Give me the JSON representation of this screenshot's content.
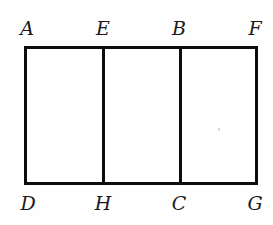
{
  "figure": {
    "type": "geometry-diagram",
    "background_color": "#fefefe",
    "stroke_color": "#0d0d0d",
    "stroke_width_px": 3,
    "labels": {
      "top": [
        {
          "id": "A",
          "text": "A"
        },
        {
          "id": "E",
          "text": "E"
        },
        {
          "id": "B",
          "text": "B"
        },
        {
          "id": "F",
          "text": "F"
        }
      ],
      "bottom": [
        {
          "id": "D",
          "text": "D"
        },
        {
          "id": "H",
          "text": "H"
        },
        {
          "id": "C",
          "text": "C"
        },
        {
          "id": "G",
          "text": "G"
        }
      ]
    },
    "shapes": {
      "outer_rectangle": {
        "corners": [
          "A",
          "F",
          "G",
          "D"
        ]
      },
      "dividers": [
        {
          "id": "EH",
          "from": "E",
          "to": "H"
        },
        {
          "id": "BC",
          "from": "B",
          "to": "C"
        }
      ],
      "cells": [
        {
          "id": "AEHD",
          "corners": [
            "A",
            "E",
            "H",
            "D"
          ]
        },
        {
          "id": "EBCH",
          "corners": [
            "E",
            "B",
            "C",
            "H"
          ]
        },
        {
          "id": "BFGC",
          "corners": [
            "B",
            "F",
            "G",
            "C"
          ]
        }
      ]
    }
  }
}
